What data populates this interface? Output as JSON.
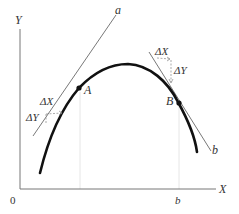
{
  "diagram": {
    "axes": {
      "y_label": "Y",
      "x_label": "X",
      "origin_label": "0",
      "x_tick_label": "b"
    },
    "points": {
      "A": "A",
      "B": "B"
    },
    "tangents": {
      "a": "a",
      "b": "b"
    },
    "deltas": {
      "left": {
        "dx": "ΔX",
        "dy": "ΔY"
      },
      "right": {
        "dx": "ΔX",
        "dy": "ΔY"
      }
    },
    "colors": {
      "curve": "#111111",
      "tangent": "#555555",
      "axis": "#777777",
      "guide": "#e6e6e6",
      "label": "#333333"
    }
  }
}
